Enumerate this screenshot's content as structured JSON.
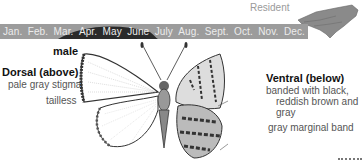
{
  "residency_status": "Resident",
  "flight_period": {
    "months": [
      "Jan.",
      "Feb.",
      "Mar.",
      "Apr.",
      "May",
      "June",
      "July",
      "Aug.",
      "Sept.",
      "Oct.",
      "Nov.",
      "Dec."
    ],
    "peak_months": [
      "Mar.",
      "Apr.",
      "May",
      "June"
    ],
    "bar_color": "#9c9c9c",
    "peak_color": "#2a2a2a"
  },
  "range_map": {
    "region": "North Carolina"
  },
  "specimen": {
    "sex_label": "male",
    "dorsal": {
      "heading": "Dorsal (above)",
      "notes": [
        "pale gray stigma",
        "tailless"
      ]
    },
    "ventral": {
      "heading": "Ventral (below)",
      "notes": [
        "banded with black,",
        "reddish brown and",
        "gray",
        "gray marginal band"
      ]
    }
  }
}
